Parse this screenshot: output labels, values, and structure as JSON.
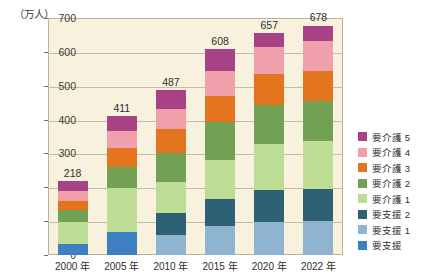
{
  "chart_data": {
    "type": "bar",
    "title": "",
    "subtitle": "",
    "unit_label": "（万人）",
    "xlabel": "",
    "ylabel": "",
    "ylim": [
      0,
      700
    ],
    "ytick_values": [
      0,
      100,
      200,
      300,
      400,
      500,
      600,
      700
    ],
    "ytick_labels": [
      "0",
      "100",
      "200",
      "300",
      "400",
      "500",
      "600",
      "700"
    ],
    "grid": true,
    "stacked": true,
    "legend_position": "right",
    "categories": [
      "2000 年",
      "2005 年",
      "2010 年",
      "2015 年",
      "2020 年",
      "2022 年"
    ],
    "totals": [
      218,
      411,
      487,
      608,
      657,
      678
    ],
    "total_labels": [
      "218",
      "411",
      "487",
      "608",
      "657",
      "678"
    ],
    "series": [
      {
        "name": "要支援",
        "color": "#3d7fc1",
        "values": [
          32,
          67,
          0,
          0,
          0,
          0
        ]
      },
      {
        "name": "要支援 1",
        "color": "#8fb4cf",
        "values": [
          0,
          0,
          60,
          87,
          97,
          99
        ]
      },
      {
        "name": "要支援 2",
        "color": "#2d6173",
        "values": [
          0,
          0,
          65,
          77,
          95,
          95
        ]
      },
      {
        "name": "要介護 1",
        "color": "#bedd94",
        "values": [
          67,
          132,
          90,
          118,
          135,
          143
        ]
      },
      {
        "name": "要介護 2",
        "color": "#72a154",
        "values": [
          33,
          62,
          85,
          110,
          116,
          117
        ]
      },
      {
        "name": "要介護 3",
        "color": "#e4751f",
        "values": [
          29,
          54,
          71,
          79,
          91,
          91
        ]
      },
      {
        "name": "要介護 4",
        "color": "#efa0ab",
        "values": [
          29,
          50,
          61,
          73,
          82,
          87
        ]
      },
      {
        "name": "要介護 5",
        "color": "#a84287",
        "values": [
          28,
          46,
          55,
          64,
          41,
          46
        ]
      }
    ],
    "legend_entries": [
      {
        "label": "要介護 5",
        "color": "#a84287"
      },
      {
        "label": "要介護 4",
        "color": "#efa0ab"
      },
      {
        "label": "要介護 3",
        "color": "#e4751f"
      },
      {
        "label": "要介護 2",
        "color": "#72a154"
      },
      {
        "label": "要介護 1",
        "color": "#bedd94"
      },
      {
        "label": "要支援 2",
        "color": "#2d6173"
      },
      {
        "label": "要支援 1",
        "color": "#8fb4cf"
      },
      {
        "label": "要支援",
        "color": "#3d7fc1"
      }
    ],
    "colors": {
      "plot_background": "#f7f1dd",
      "plot_border": "#b9b2a0",
      "gridline": "#c3bcab",
      "text": "#2e2e2e",
      "page_background": "#ffffff"
    }
  }
}
